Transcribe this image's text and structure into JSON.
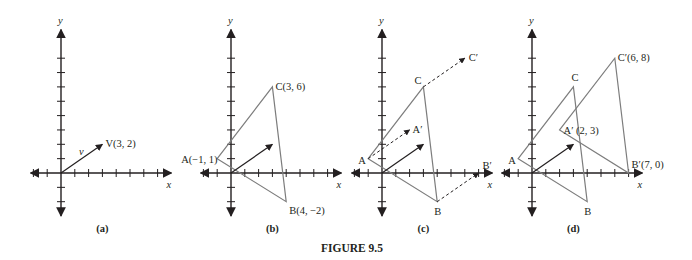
{
  "caption": "FIGURE 9.5",
  "axis_labels": {
    "x": "x",
    "y": "y"
  },
  "layout": {
    "origin_y": 173,
    "scale_x": 13.8,
    "scale_y": 14.35,
    "x_min": -2.2,
    "x_max": 8.0,
    "y_min": -3.0,
    "y_max": 10.0,
    "x_ticks": [
      -2,
      -1,
      1,
      2,
      3,
      4,
      5,
      6,
      7
    ],
    "y_ticks": [
      -2,
      -1,
      1,
      2,
      3,
      4,
      5,
      6,
      7,
      8
    ]
  },
  "colors": {
    "ink": "#231f20",
    "triangle": "#7d7d7d"
  },
  "panels": [
    {
      "id": "a",
      "label": "(a)",
      "origin_x": 61,
      "vector": {
        "from": [
          0,
          0
        ],
        "to": [
          3,
          2
        ]
      },
      "vector_name": "v",
      "vector_label": "V(3, 2)",
      "triangles": [],
      "dashed_arrows": [],
      "point_labels": []
    },
    {
      "id": "b",
      "label": "(b)",
      "origin_x": 231,
      "vector": {
        "from": [
          0,
          0
        ],
        "to": [
          3,
          2
        ]
      },
      "triangles": [
        {
          "points": [
            [
              -1,
              1
            ],
            [
              4,
              -2
            ],
            [
              3,
              6
            ]
          ]
        }
      ],
      "dashed_arrows": [],
      "point_labels": [
        {
          "text": "A(−1, 1)",
          "at": [
            -1,
            1
          ],
          "dx": -36,
          "dy": 4
        },
        {
          "text": "C(3, 6)",
          "at": [
            3,
            6
          ],
          "dx": 3,
          "dy": 3
        },
        {
          "text": "B(4, −2)",
          "at": [
            4,
            -2
          ],
          "dx": 3,
          "dy": 12
        }
      ]
    },
    {
      "id": "c",
      "label": "(c)",
      "origin_x": 382,
      "vector": {
        "from": [
          0,
          0
        ],
        "to": [
          3,
          2
        ]
      },
      "triangles": [
        {
          "points": [
            [
              -1,
              1
            ],
            [
              4,
              -2
            ],
            [
              3,
              6
            ]
          ]
        }
      ],
      "dashed_arrows": [
        {
          "from": [
            -1,
            1
          ],
          "to": [
            2,
            3
          ]
        },
        {
          "from": [
            4,
            -2
          ],
          "to": [
            7,
            0
          ]
        },
        {
          "from": [
            3,
            6
          ],
          "to": [
            6,
            8
          ]
        }
      ],
      "point_labels": [
        {
          "text": "A",
          "at": [
            -1,
            1
          ],
          "dx": -10,
          "dy": 5
        },
        {
          "text": "C",
          "at": [
            3,
            6
          ],
          "dx": -9,
          "dy": -3
        },
        {
          "text": "B",
          "at": [
            4,
            -2
          ],
          "dx": -3,
          "dy": 13
        },
        {
          "text": "A′",
          "at": [
            2,
            3
          ],
          "dx": 3,
          "dy": 3
        },
        {
          "text": "B′",
          "at": [
            7,
            0
          ],
          "dx": 4,
          "dy": -4
        },
        {
          "text": "C′",
          "at": [
            6,
            8
          ],
          "dx": 4,
          "dy": 3
        }
      ]
    },
    {
      "id": "d",
      "label": "(d)",
      "origin_x": 532,
      "vector": {
        "from": [
          0,
          0
        ],
        "to": [
          3,
          2
        ]
      },
      "triangles": [
        {
          "points": [
            [
              -1,
              1
            ],
            [
              4,
              -2
            ],
            [
              3,
              6
            ]
          ]
        },
        {
          "points": [
            [
              2,
              3
            ],
            [
              7,
              0
            ],
            [
              6,
              8
            ]
          ]
        }
      ],
      "dashed_arrows": [],
      "point_labels": [
        {
          "text": "A",
          "at": [
            -1,
            1
          ],
          "dx": -10,
          "dy": 5
        },
        {
          "text": "C",
          "at": [
            3,
            6
          ],
          "dx": -2,
          "dy": -6
        },
        {
          "text": "B",
          "at": [
            4,
            -2
          ],
          "dx": -3,
          "dy": 13
        },
        {
          "text": "A′ (2, 3)",
          "at": [
            2,
            3
          ],
          "dx": 4,
          "dy": 4
        },
        {
          "text": "B′(7, 0)",
          "at": [
            7,
            0
          ],
          "dx": 3,
          "dy": -5
        },
        {
          "text": "C′(6, 8)",
          "at": [
            6,
            8
          ],
          "dx": 3,
          "dy": 3
        }
      ]
    }
  ]
}
